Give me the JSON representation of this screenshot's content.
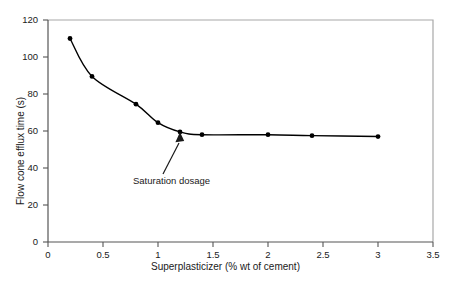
{
  "chart_data": {
    "type": "line",
    "title": "",
    "xlabel": "Superplasticizer (% wt of cement)",
    "ylabel": "Flow cone efflux time (s)",
    "xlim": [
      0,
      3.5
    ],
    "ylim": [
      0,
      120
    ],
    "xticks": [
      "0",
      "0.5",
      "1",
      "1.5",
      "2",
      "2.5",
      "3",
      "3.5"
    ],
    "xtick_values": [
      0,
      0.5,
      1,
      1.5,
      2,
      2.5,
      3,
      3.5
    ],
    "yticks": [
      "0",
      "20",
      "40",
      "60",
      "80",
      "100",
      "120"
    ],
    "ytick_values": [
      0,
      20,
      40,
      60,
      80,
      100,
      120
    ],
    "grid": false,
    "legend": null,
    "series": [
      {
        "name": "Flow cone efflux time",
        "marker": "filled-circle",
        "color": "#000000",
        "x": [
          0.2,
          0.4,
          0.8,
          1.0,
          1.2,
          1.4,
          2.0,
          2.4,
          3.0
        ],
        "values": [
          110,
          89.5,
          74.5,
          64.5,
          59.5,
          58,
          58,
          57.5,
          57
        ]
      }
    ],
    "annotations": [
      {
        "text": "Saturation dosage",
        "points_to_x": 1.2,
        "points_to_y": 59.5,
        "arrow": true
      }
    ]
  },
  "axes": {
    "x_title": "Superplasticizer (% wt of cement)",
    "y_title": "Flow cone efflux time (s)",
    "x_tick_labels": [
      "0",
      "0.5",
      "1",
      "1.5",
      "2",
      "2.5",
      "3",
      "3.5"
    ],
    "y_tick_labels": [
      "0",
      "20",
      "40",
      "60",
      "80",
      "100",
      "120"
    ]
  },
  "annotation": {
    "label": "Saturation dosage"
  },
  "colors": {
    "line": "#1a1a1a",
    "marker": "#000000",
    "frame": "#9a9a9a",
    "axis": "#4d4d4d",
    "background": "#ffffff"
  }
}
